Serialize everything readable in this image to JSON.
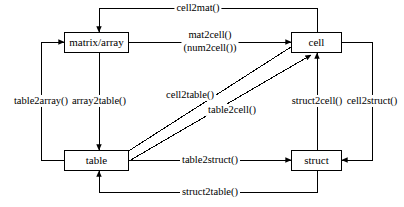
{
  "diagram": {
    "colors": {
      "stroke": "#000000",
      "background": "#ffffff",
      "text": "#000000"
    },
    "nodes": [
      {
        "id": "matrix",
        "label": "matrix/array",
        "x": 64,
        "y": 32,
        "w": 65,
        "h": 21
      },
      {
        "id": "cell",
        "label": "cell",
        "x": 291,
        "y": 32,
        "w": 51,
        "h": 21
      },
      {
        "id": "table",
        "label": "table",
        "x": 64,
        "y": 150,
        "w": 65,
        "h": 21
      },
      {
        "id": "struct",
        "label": "struct",
        "x": 291,
        "y": 150,
        "w": 51,
        "h": 21
      }
    ],
    "edges": [
      {
        "id": "cell2mat",
        "label": "cell2mat()",
        "from": "cell",
        "to": "matrix",
        "label_x": 198,
        "label_y": 8
      },
      {
        "id": "mat2cell",
        "label": "mat2cell()",
        "label2": "(num2cell())",
        "from": "matrix",
        "to": "cell",
        "label_x": 210,
        "label_y": 42
      },
      {
        "id": "table2array",
        "label": "table2array()",
        "from": "table",
        "to": "matrix",
        "label_x": 41,
        "label_y": 101
      },
      {
        "id": "array2table",
        "label": "array2table()",
        "from": "matrix",
        "to": "table",
        "label_x": 99,
        "label_y": 101
      },
      {
        "id": "cell2table",
        "label": "cell2table()",
        "from": "cell",
        "to": "table",
        "label_x": 190,
        "label_y": 95
      },
      {
        "id": "table2cell",
        "label": "table2cell()",
        "from": "table",
        "to": "cell",
        "label_x": 232,
        "label_y": 110
      },
      {
        "id": "struct2cell",
        "label": "struct2cell()",
        "from": "struct",
        "to": "cell",
        "label_x": 317,
        "label_y": 101
      },
      {
        "id": "cell2struct",
        "label": "cell2struct()",
        "from": "cell",
        "to": "struct",
        "label_x": 372,
        "label_y": 101
      },
      {
        "id": "table2struct",
        "label": "table2struct()",
        "from": "table",
        "to": "struct",
        "label_x": 210,
        "label_y": 160
      },
      {
        "id": "struct2table",
        "label": "struct2table()",
        "from": "struct",
        "to": "table",
        "label_x": 210,
        "label_y": 192
      }
    ]
  }
}
